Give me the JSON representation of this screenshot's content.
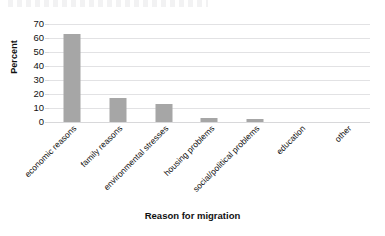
{
  "chart_data": {
    "type": "bar",
    "title": "",
    "xlabel": "Reason for migration",
    "ylabel": "Percent",
    "categories": [
      "economic reasons",
      "family reasons",
      "environmental stresses",
      "housing problems",
      "social/political problems",
      "education",
      "other"
    ],
    "values": [
      63,
      17,
      13,
      3,
      2,
      0,
      0
    ],
    "ylim": [
      0,
      70
    ],
    "ytick_labels": [
      "70",
      "60",
      "50",
      "40",
      "30",
      "20",
      "10",
      "0"
    ],
    "ytick_values": [
      70,
      60,
      50,
      40,
      30,
      20,
      10,
      0
    ],
    "ystep": 10,
    "grid": true,
    "legend": false,
    "legend_position": "none",
    "bar_color": "#a6a6a6",
    "gridline_color": "#e2e2e4",
    "background_color": "#ffffff",
    "text_color": "#111111",
    "xtick_rotation_deg": -45
  }
}
